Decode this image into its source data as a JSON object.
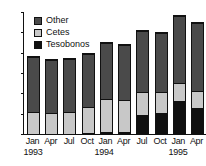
{
  "chart_data": {
    "type": "bar",
    "title": "",
    "xlabel": "",
    "ylabel": "",
    "ylim": [
      0,
      300
    ],
    "ytick_step": 50,
    "grid": false,
    "stacked": true,
    "legend_position": "top-left",
    "categories": [
      "Jan",
      "Apr",
      "Jul",
      "Oct",
      "Jan",
      "Apr",
      "Jul",
      "Oct",
      "Jan",
      "Apr"
    ],
    "year_labels": [
      "1993",
      "1994",
      "1995"
    ],
    "yticks": [
      "0",
      "50",
      "100",
      "150",
      "200",
      "250",
      "300"
    ],
    "series": [
      {
        "name": "Tesobonos",
        "color": "#101010",
        "values": [
          0,
          0,
          0,
          3,
          4,
          4,
          47,
          51,
          82,
          63
        ]
      },
      {
        "name": "Cetes",
        "color": "#c8c8c8",
        "values": [
          52,
          48,
          51,
          62,
          79,
          76,
          53,
          49,
          41,
          41
        ]
      },
      {
        "name": "Other",
        "color": "#4a4a4a",
        "values": [
          132,
          128,
          129,
          127,
          137,
          133,
          148,
          144,
          162,
          164
        ]
      }
    ],
    "totals": [
      184,
      176,
      180,
      192,
      220,
      213,
      248,
      244,
      285,
      268
    ]
  },
  "legend": {
    "items": [
      {
        "label": "Other",
        "swatch": "dark-gray"
      },
      {
        "label": "Cetes",
        "swatch": "light-gray"
      },
      {
        "label": "Tesobonos",
        "swatch": "black"
      }
    ]
  }
}
